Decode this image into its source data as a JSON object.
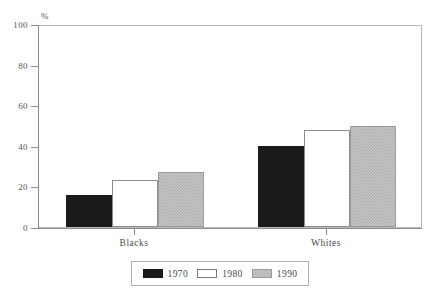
{
  "chart_data": {
    "type": "bar",
    "title": "",
    "subtitle": "",
    "xlabel": "",
    "ylabel": "%",
    "ylim": [
      0,
      100
    ],
    "yticks": [
      0,
      20,
      40,
      60,
      80,
      100
    ],
    "ytick_labels": [
      "0",
      "20",
      "40",
      "60",
      "80",
      "100"
    ],
    "grid": false,
    "legend_position": "bottom",
    "categories": [
      "Blacks",
      "Whites"
    ],
    "series": [
      {
        "name": "1970",
        "values": [
          16,
          40
        ],
        "color": "#1a1a1a",
        "fill": "solid-black"
      },
      {
        "name": "1980",
        "values": [
          23,
          48
        ],
        "color": "#ffffff",
        "fill": "open-white"
      },
      {
        "name": "1990",
        "values": [
          27,
          50
        ],
        "color": "#c9c9c9",
        "fill": "hatched-gray"
      }
    ]
  },
  "axes": {
    "unit_label": "%",
    "y_tick_labels": [
      "100",
      "80",
      "60",
      "40",
      "20",
      "0"
    ],
    "x_tick_labels": [
      "Blacks",
      "Whites"
    ]
  },
  "legend": {
    "items": [
      {
        "label": "1970"
      },
      {
        "label": "1980"
      },
      {
        "label": "1990"
      }
    ]
  },
  "colors": {
    "series_1970": "#1a1a1a",
    "series_1980": "#ffffff",
    "series_1990": "#c9c9c9",
    "axis": "#8d8d8d",
    "frame": "#b9b9b9",
    "text": "#4a4a4a",
    "background": "#ffffff"
  }
}
